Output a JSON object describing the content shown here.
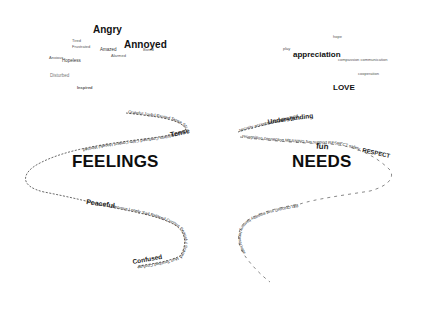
{
  "feelings": {
    "title": "FEELINGS",
    "cloud": [
      {
        "text": "Angry",
        "size": "xl",
        "x": 93,
        "y": 25
      },
      {
        "text": "Annoyed",
        "size": "xl",
        "x": 124,
        "y": 40
      },
      {
        "text": "Tired",
        "size": "xs",
        "x": 72,
        "y": 39
      },
      {
        "text": "Frustrated",
        "size": "xs",
        "x": 72,
        "y": 45
      },
      {
        "text": "Amazed",
        "size": "sm",
        "x": 100,
        "y": 48
      },
      {
        "text": "Bored",
        "size": "xs",
        "x": 143,
        "y": 48
      },
      {
        "text": "Alarmed",
        "size": "xs",
        "x": 111,
        "y": 54
      },
      {
        "text": "Hopeless",
        "size": "sm",
        "x": 62,
        "y": 59
      },
      {
        "text": "Anxious",
        "size": "xs",
        "x": 49,
        "y": 56
      },
      {
        "text": "Disturbed",
        "size": "sm",
        "x": 50,
        "y": 74
      },
      {
        "text": "Inspired",
        "size": "xs",
        "x": 77,
        "y": 86
      }
    ],
    "path_words_upper": "Grateful Joyful Excited Tense Stressed Helpless Confused Calm Content Hopeful Worried",
    "path_words_lower": "Nervous Lonely Sad Relaxed Curious Peaceful Scared Hurt Touched Confused Curious",
    "path_highlight": [
      "Tense",
      "Peaceful",
      "Confused"
    ]
  },
  "needs": {
    "title": "NEEDS",
    "cloud": [
      {
        "text": "hope",
        "size": "xs",
        "x": 333,
        "y": 35
      },
      {
        "text": "play",
        "size": "xs",
        "x": 283,
        "y": 47
      },
      {
        "text": "appreciation",
        "size": "lg",
        "x": 293,
        "y": 51
      },
      {
        "text": "compassion communication",
        "size": "xs",
        "x": 338,
        "y": 58
      },
      {
        "text": "cooperation",
        "size": "xs",
        "x": 358,
        "y": 72
      },
      {
        "text": "LOVE",
        "size": "lg",
        "x": 333,
        "y": 84
      }
    ],
    "path_words_upper": "security acceptance Understanding",
    "path_words_middle": "recognition connection MEANING fun support RESPECT safety",
    "path_words_lower": "BELONGING trust empathy harmony honesty hope",
    "path_words_tail": "growth purpose Contribution space rest",
    "path_highlight": [
      "Understanding",
      "fun",
      "RESPECT"
    ]
  }
}
